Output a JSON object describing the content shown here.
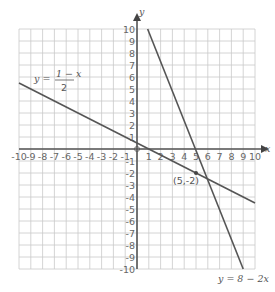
{
  "chart_data": {
    "type": "line",
    "title": "",
    "xlabel": "x",
    "ylabel": "y",
    "xlim": [
      -10,
      10
    ],
    "ylim": [
      -10,
      10
    ],
    "grid": true,
    "x_ticks": [
      -10,
      -9,
      -8,
      -7,
      -6,
      -5,
      -4,
      -3,
      -2,
      -1,
      1,
      2,
      3,
      4,
      5,
      6,
      7,
      8,
      9,
      10
    ],
    "y_ticks": [
      10,
      9,
      8,
      7,
      6,
      5,
      4,
      3,
      2,
      1,
      -1,
      -2,
      -3,
      -4,
      -5,
      -6,
      -7,
      -8,
      -9,
      -10
    ],
    "origin_label": "0",
    "series": [
      {
        "name": "y = (1 - x) / 2",
        "label_prefix": "y =",
        "label_numerator": "1 − x",
        "label_denominator": "2",
        "x": [
          -10,
          10
        ],
        "y": [
          5.5,
          -4.5
        ]
      },
      {
        "name": "y = 8 − 2x",
        "label": "y = 8 − 2x",
        "x": [
          0.9,
          9
        ],
        "y": [
          10,
          -10
        ]
      }
    ],
    "annotations": [
      {
        "text": "(5,-2)",
        "x": 5,
        "y": -2,
        "type": "intersection-point"
      }
    ]
  }
}
